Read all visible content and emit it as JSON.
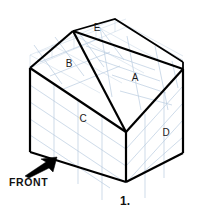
{
  "figure": {
    "number_label": "1.",
    "front_label": "FRONT",
    "surface_labels": [
      {
        "id": "A",
        "text": "A",
        "x": 135,
        "y": 78,
        "face": "right-roof-slope"
      },
      {
        "id": "B",
        "text": "B",
        "x": 69,
        "y": 64,
        "face": "left-roof-slope"
      },
      {
        "id": "C",
        "text": "C",
        "x": 83,
        "y": 119,
        "face": "front-left-wall"
      },
      {
        "id": "D",
        "text": "D",
        "x": 166,
        "y": 133,
        "face": "right-end-wall"
      },
      {
        "id": "E",
        "text": "E",
        "x": 97,
        "y": 28,
        "face": "ridge-top-sliver"
      }
    ],
    "colors": {
      "outline": "#000000",
      "grid": "#b9cbe0",
      "grid_faint": "#cfdcea",
      "background": "#ffffff",
      "text": "#111111"
    },
    "arrow": {
      "name": "front-direction-arrow",
      "direction": "up-right"
    },
    "geometry": {
      "description": "isometric gable-roof house block on grid",
      "vertices": {
        "apex_front": [
          73,
          31
        ],
        "apex_back": [
          115,
          19
        ],
        "ridge_right": [
          183,
          69
        ],
        "eave_left_front": [
          30,
          68
        ],
        "eave_left_back": [
          30,
          55
        ],
        "gable_bottom": [
          126,
          132
        ],
        "wall_bottom_left": [
          30,
          152
        ],
        "wall_bottom_front": [
          126,
          182
        ],
        "wall_right_bottom": [
          183,
          153
        ],
        "wall_right_top": [
          183,
          69
        ]
      }
    }
  }
}
